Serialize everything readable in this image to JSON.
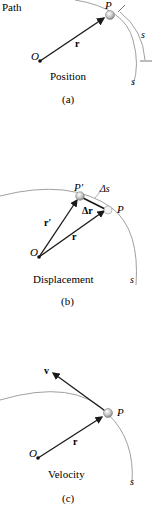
{
  "panel_a": {
    "path_label": "Path",
    "point_label": "P",
    "origin_label": "O",
    "vector_label": "r",
    "arc_label_1": "s",
    "arc_label_2": "s",
    "title": "Position",
    "caption": "(a)"
  },
  "panel_b": {
    "point_prime_label": "P′",
    "point_label": "P",
    "origin_label": "O",
    "vector_r_label": "r",
    "vector_rprime_label": "r′",
    "delta_r_label": "Δr",
    "delta_s_label": "Δs",
    "arc_label": "s",
    "title": "Displacement",
    "caption": "(b)"
  },
  "panel_c": {
    "velocity_label": "v",
    "point_label": "P",
    "origin_label": "O",
    "vector_label": "r",
    "arc_label": "s",
    "title": "Velocity",
    "caption": "(c)"
  },
  "colors": {
    "path": "#a0a0a0",
    "vector": "#1a1a1a",
    "particle": "#b8b8b8"
  }
}
